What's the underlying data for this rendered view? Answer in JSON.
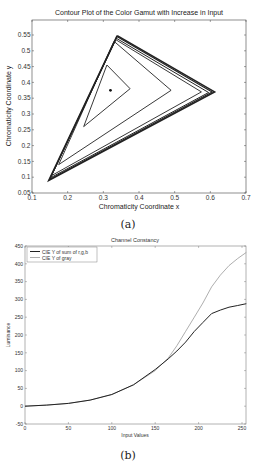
{
  "chart_data": [
    {
      "type": "line",
      "id": "a",
      "title": "Contour Plot of the Color Gamut with Increase in Input",
      "xlabel": "Chromaticity Coordinate x",
      "ylabel": "Chromaticity Coordinate y",
      "caption": "(a)",
      "xlim": [
        0.1,
        0.7
      ],
      "ylim": [
        0.05,
        0.6
      ],
      "xticks": [
        "0.1",
        "0.2",
        "0.3",
        "0.4",
        "0.5",
        "0.6",
        "0.7"
      ],
      "yticks": [
        "0.05",
        "0.1",
        "0.15",
        "0.2",
        "0.25",
        "0.3",
        "0.35",
        "0.4",
        "0.45",
        "0.5",
        "0.55"
      ],
      "grid": false,
      "series": [
        {
          "name": "contour-1",
          "points": [
            [
              0.31,
              0.455
            ],
            [
              0.375,
              0.38
            ],
            [
              0.245,
              0.26
            ],
            [
              0.31,
              0.455
            ]
          ]
        },
        {
          "name": "contour-2",
          "points": [
            [
              0.33,
              0.53
            ],
            [
              0.49,
              0.375
            ],
            [
              0.175,
              0.14
            ],
            [
              0.33,
              0.53
            ]
          ]
        },
        {
          "name": "contour-3",
          "points": [
            [
              0.335,
              0.535
            ],
            [
              0.575,
              0.37
            ],
            [
              0.155,
              0.105
            ],
            [
              0.335,
              0.535
            ]
          ]
        },
        {
          "name": "contour-4",
          "points": [
            [
              0.336,
              0.54
            ],
            [
              0.595,
              0.368
            ],
            [
              0.152,
              0.098
            ],
            [
              0.336,
              0.54
            ]
          ]
        },
        {
          "name": "contour-5",
          "points": [
            [
              0.338,
              0.545
            ],
            [
              0.605,
              0.37
            ],
            [
              0.149,
              0.093
            ],
            [
              0.338,
              0.545
            ]
          ]
        },
        {
          "name": "contour-6",
          "points": [
            [
              0.339,
              0.548
            ],
            [
              0.612,
              0.37
            ],
            [
              0.147,
              0.09
            ],
            [
              0.339,
              0.548
            ]
          ]
        }
      ],
      "point": [
        0.32,
        0.375
      ]
    },
    {
      "type": "line",
      "id": "b",
      "title": "Channel Constancy",
      "xlabel": "Input Values",
      "ylabel": "Luminance",
      "caption": "(b)",
      "xlim": [
        0,
        255
      ],
      "ylim": [
        -50,
        450
      ],
      "xticks": [
        "0",
        "50",
        "100",
        "150",
        "200",
        "250"
      ],
      "yticks": [
        "-50",
        "0",
        "50",
        "100",
        "150",
        "200",
        "250",
        "300",
        "350",
        "400",
        "450"
      ],
      "grid": false,
      "legend_position": "upper-left",
      "x": [
        0,
        25,
        50,
        75,
        100,
        125,
        150,
        165,
        175,
        185,
        195,
        205,
        215,
        225,
        235,
        245,
        255
      ],
      "series": [
        {
          "name": "CIE Y of sum of r,g,b",
          "color": "#222222",
          "values": [
            0,
            3,
            8,
            17,
            33,
            60,
            103,
            133,
            155,
            180,
            210,
            235,
            260,
            270,
            278,
            283,
            288
          ]
        },
        {
          "name": "CIE Y of gray",
          "color": "#999999",
          "values": [
            0,
            3,
            8,
            17,
            33,
            60,
            100,
            135,
            170,
            210,
            250,
            290,
            335,
            368,
            395,
            415,
            432
          ]
        }
      ]
    }
  ]
}
